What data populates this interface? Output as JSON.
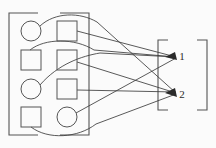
{
  "figure": {
    "background_color": "#fbfbfb",
    "stroke_color": "#4a4a4a",
    "width": 216,
    "height": 148
  },
  "input_group": {
    "name": "input-set",
    "bracket_style": "square-bracket",
    "rows": [
      {
        "row": 1,
        "cells": [
          {
            "id": "r1c1",
            "shape": "circle",
            "cx": 31,
            "cy": 31,
            "r": 10
          },
          {
            "id": "r1c2",
            "shape": "square",
            "x": 57,
            "y": 21,
            "w": 20,
            "h": 20
          }
        ]
      },
      {
        "row": 2,
        "cells": [
          {
            "id": "r2c1",
            "shape": "square",
            "x": 21,
            "y": 50,
            "w": 20,
            "h": 20
          },
          {
            "id": "r2c2",
            "shape": "square",
            "x": 57,
            "y": 50,
            "w": 20,
            "h": 20
          }
        ]
      },
      {
        "row": 3,
        "cells": [
          {
            "id": "r3c1",
            "shape": "circle",
            "cx": 31,
            "cy": 89,
            "r": 10
          },
          {
            "id": "r3c2",
            "shape": "square",
            "x": 57,
            "y": 79,
            "w": 20,
            "h": 20
          }
        ]
      },
      {
        "row": 4,
        "cells": [
          {
            "id": "r4c1",
            "shape": "square",
            "x": 21,
            "y": 107,
            "w": 20,
            "h": 20
          },
          {
            "id": "r4c2",
            "shape": "circle",
            "cx": 67,
            "cy": 117,
            "r": 10
          }
        ]
      }
    ]
  },
  "output_group": {
    "name": "output-set",
    "bracket_style": "square-bracket",
    "nodes": [
      {
        "id": "out1",
        "label": "1",
        "x": 168,
        "y": 56
      },
      {
        "id": "out2",
        "label": "2",
        "x": 168,
        "y": 94
      }
    ]
  },
  "connections": [
    {
      "from": "r1c1",
      "to": "out2",
      "kind": "curve"
    },
    {
      "from": "r1c2",
      "to": "out1",
      "kind": "line"
    },
    {
      "from": "r2c1",
      "to": "out1",
      "kind": "curve"
    },
    {
      "from": "r2c2",
      "to": "out2",
      "kind": "line"
    },
    {
      "from": "r3c1",
      "to": "out1",
      "kind": "curve"
    },
    {
      "from": "r3c2",
      "to": "out2",
      "kind": "line"
    },
    {
      "from": "r4c1",
      "to": "out2",
      "kind": "curve"
    },
    {
      "from": "r4c2",
      "to": "out1",
      "kind": "line"
    }
  ],
  "counts": {
    "circles": 3,
    "squares": 5,
    "outputs": 2
  }
}
